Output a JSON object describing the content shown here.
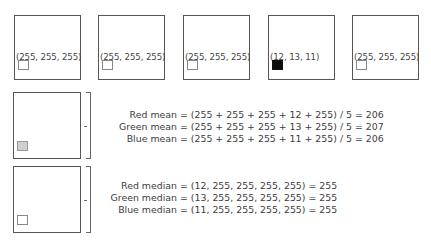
{
  "pixels": [
    {
      "label": "(255, 255, 255)",
      "color": "#ffffff"
    },
    {
      "label": "(255, 255, 255)",
      "color": "#ffffff"
    },
    {
      "label": "(255, 255, 255)",
      "color": "#ffffff"
    },
    {
      "label": "(12, 13, 11)",
      "color": "#0c0d0b"
    },
    {
      "label": "(255, 255, 255)",
      "color": "#ffffff"
    }
  ],
  "mean": {
    "result_color": "#cecfce",
    "lines": [
      {
        "name": "Red mean",
        "expr": "= (255 + 255 + 255 + 12 + 255) / 5 = 206"
      },
      {
        "name": "Green mean",
        "expr": "= (255 + 255 + 255 + 13 + 255) / 5 = 207"
      },
      {
        "name": "Blue mean",
        "expr": "= (255 + 255 + 255 + 11 + 255) / 5 = 206"
      }
    ]
  },
  "median": {
    "result_color": "#ffffff",
    "lines": [
      {
        "name": "Red median",
        "expr": "= (12, 255, 255, 255, 255) = 255"
      },
      {
        "name": "Green median",
        "expr": "= (13, 255, 255, 255, 255) = 255"
      },
      {
        "name": "Blue median",
        "expr": "= (11, 255, 255, 255, 255) = 255"
      }
    ]
  }
}
